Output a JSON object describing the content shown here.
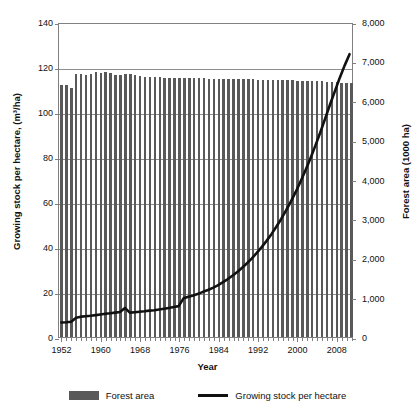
{
  "chart_data": {
    "type": "bar",
    "title": "",
    "xlabel": "Year",
    "ylabel": "Growing stock per hectare, (m³/ha)",
    "ylabel_right": "Forest area (1000 ha)",
    "ylim": [
      0,
      140
    ],
    "ylim_right": [
      0,
      8000
    ],
    "yticks": [
      0,
      20,
      40,
      60,
      80,
      100,
      120,
      140
    ],
    "ytick_labels": [
      "0",
      "20",
      "40",
      "60",
      "80",
      "100",
      "120",
      "140"
    ],
    "yticks_right": [
      0,
      1000,
      2000,
      3000,
      4000,
      5000,
      6000,
      7000,
      8000
    ],
    "ytick_labels_right": [
      "0",
      "1,000",
      "2,000",
      "3,000",
      "4,000",
      "5,000",
      "6,000",
      "7,000",
      "8,000"
    ],
    "xlim": [
      1952,
      2011
    ],
    "xtick_labels": [
      "1952",
      "1960",
      "1968",
      "1976",
      "1984",
      "1992",
      "2000",
      "2008"
    ],
    "xticks": [
      1952,
      1960,
      1968,
      1976,
      1984,
      1992,
      2000,
      2008
    ],
    "grid": true,
    "legend_position": "bottom",
    "x": [
      1952,
      1953,
      1954,
      1955,
      1956,
      1957,
      1958,
      1959,
      1960,
      1961,
      1962,
      1963,
      1964,
      1965,
      1966,
      1967,
      1968,
      1969,
      1970,
      1971,
      1972,
      1973,
      1974,
      1975,
      1976,
      1977,
      1978,
      1979,
      1980,
      1981,
      1982,
      1983,
      1984,
      1985,
      1986,
      1987,
      1988,
      1989,
      1990,
      1991,
      1992,
      1993,
      1994,
      1995,
      1996,
      1997,
      1998,
      1999,
      2000,
      2001,
      2002,
      2003,
      2004,
      2005,
      2006,
      2007,
      2008,
      2009,
      2010,
      2011
    ],
    "series": [
      {
        "name": "Forest area",
        "type": "bar",
        "axis": "right",
        "unit": "1000 ha",
        "values": [
          6400,
          6390,
          6330,
          6680,
          6690,
          6660,
          6680,
          6720,
          6700,
          6740,
          6700,
          6660,
          6650,
          6680,
          6670,
          6660,
          6630,
          6610,
          6600,
          6600,
          6600,
          6590,
          6590,
          6590,
          6580,
          6580,
          6580,
          6570,
          6570,
          6570,
          6560,
          6560,
          6560,
          6560,
          6560,
          6550,
          6550,
          6550,
          6550,
          6550,
          6540,
          6540,
          6540,
          6530,
          6530,
          6530,
          6520,
          6520,
          6510,
          6510,
          6500,
          6500,
          6490,
          6490,
          6480,
          6480,
          6470,
          6460,
          6450,
          6440
        ]
      },
      {
        "name": "Growing stock per hectare",
        "type": "line",
        "axis": "left",
        "unit": "m³/ha",
        "values": [
          6.5,
          6.6,
          6.8,
          8.6,
          9.1,
          9.3,
          9.5,
          9.8,
          10.1,
          10.4,
          10.6,
          10.9,
          11.2,
          13.0,
          10.9,
          11.1,
          11.3,
          11.5,
          11.8,
          12.0,
          12.3,
          12.6,
          13.0,
          13.4,
          13.8,
          17.3,
          18.0,
          18.6,
          19.3,
          20.2,
          21.0,
          22.0,
          23.1,
          24.4,
          25.8,
          27.4,
          29.1,
          31.0,
          33.0,
          35.2,
          37.6,
          40.2,
          43.0,
          46.0,
          49.3,
          52.8,
          56.6,
          60.7,
          65.0,
          69.7,
          74.7,
          80.0,
          85.6,
          91.5,
          97.7,
          104.0,
          110.0,
          116.0,
          121.5,
          126.5
        ]
      }
    ]
  },
  "legend": {
    "items": [
      {
        "label": "Forest area",
        "swatch": "bar-swatch",
        "color": "#595959"
      },
      {
        "label": "Growing stock per hectare",
        "swatch": "line-swatch",
        "color": "#111111"
      }
    ]
  },
  "colors": {
    "bar": "#595959",
    "line": "#111111",
    "grid": "#8d8d8d",
    "axis": "#808080",
    "background": "#ffffff"
  }
}
